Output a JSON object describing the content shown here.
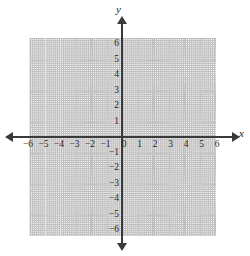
{
  "figure": {
    "type": "cartesian-coordinate-plane",
    "top_remnant_text": "",
    "axis_names": {
      "x": "x",
      "y": "y"
    },
    "colors": {
      "background": "#ffffff",
      "axis": "#3a3a3a",
      "grid": "#c4c4c4",
      "grid_pale": "#e6e6e6",
      "label": "#1f1f1f"
    }
  },
  "chart_data": {
    "type": "scatter",
    "title": "",
    "subtitle": "",
    "xlabel": "x",
    "ylabel": "y",
    "xlim": [
      -6,
      6
    ],
    "ylim": [
      -6,
      6
    ],
    "xticks": [
      -6,
      -5,
      -4,
      -3,
      -2,
      -1,
      0,
      1,
      2,
      3,
      4,
      5,
      6
    ],
    "yticks": [
      6,
      5,
      4,
      3,
      2,
      1,
      -1,
      -2,
      -3,
      -4,
      -5,
      -6
    ],
    "xtick_labels": [
      "−6",
      "−5",
      "−4",
      "−3",
      "−2",
      "−1",
      "0",
      "1",
      "2",
      "3",
      "4",
      "5",
      "6"
    ],
    "ytick_labels": [
      "6",
      "5",
      "4",
      "3",
      "2",
      "1",
      "−1",
      "−2",
      "−3",
      "−4",
      "−5",
      "−6"
    ],
    "grid": true,
    "grid_style": "dotted",
    "grid_spacing": 1,
    "legend": null,
    "series": [],
    "points": [],
    "annotations": [],
    "axis_arrows": [
      "left",
      "right",
      "up",
      "down"
    ],
    "origin_label": "0"
  },
  "x_axis_labels": [
    {
      "value": -6,
      "text": "−6"
    },
    {
      "value": -5,
      "text": "−5"
    },
    {
      "value": -4,
      "text": "−4"
    },
    {
      "value": -3,
      "text": "−3"
    },
    {
      "value": -2,
      "text": "−2"
    },
    {
      "value": -1,
      "text": "−1"
    },
    {
      "value": 0,
      "text": "0"
    },
    {
      "value": 1,
      "text": "1"
    },
    {
      "value": 2,
      "text": "2"
    },
    {
      "value": 3,
      "text": "3"
    },
    {
      "value": 4,
      "text": "4"
    },
    {
      "value": 5,
      "text": "5"
    },
    {
      "value": 6,
      "text": "6"
    }
  ],
  "y_axis_labels": [
    {
      "value": 6,
      "text": "6"
    },
    {
      "value": 5,
      "text": "5"
    },
    {
      "value": 4,
      "text": "4"
    },
    {
      "value": 3,
      "text": "3"
    },
    {
      "value": 2,
      "text": "2"
    },
    {
      "value": 1,
      "text": "1"
    },
    {
      "value": -1,
      "text": "−1"
    },
    {
      "value": -2,
      "text": "−2"
    },
    {
      "value": -3,
      "text": "−3"
    },
    {
      "value": -4,
      "text": "−4"
    },
    {
      "value": -5,
      "text": "−5"
    },
    {
      "value": -6,
      "text": "−6"
    }
  ]
}
